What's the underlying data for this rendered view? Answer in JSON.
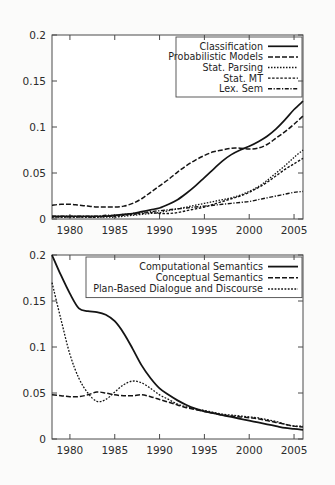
{
  "page": {
    "background": "#fbfbfa",
    "plot_background": "#ffffff",
    "axis_color": "#4a4a4a",
    "line_color": "#141414"
  },
  "chart_data": [
    {
      "id": "top",
      "type": "line",
      "title": "",
      "xlabel": "",
      "ylabel": "",
      "xlim": [
        1978,
        2006
      ],
      "ylim": [
        0,
        0.2
      ],
      "xticks": [
        1980,
        1985,
        1990,
        1995,
        2000,
        2005
      ],
      "yticks": [
        0,
        0.05,
        0.1,
        0.15,
        0.2
      ],
      "ytick_labels": [
        "0",
        "0.05",
        "0.1",
        "0.15",
        "0.2"
      ],
      "xtick_labels": [
        "1980",
        "1985",
        "1990",
        "1995",
        "2000",
        "2005"
      ],
      "grid": false,
      "legend_position": "top-right",
      "x": [
        1978,
        1979,
        1980,
        1981,
        1982,
        1983,
        1984,
        1985,
        1986,
        1987,
        1988,
        1989,
        1990,
        1991,
        1992,
        1993,
        1994,
        1995,
        1996,
        1997,
        1998,
        1999,
        2000,
        2001,
        2002,
        2003,
        2004,
        2005,
        2006
      ],
      "series": [
        {
          "name": "Classification",
          "style": "solid",
          "width": 1.7,
          "dash": "none",
          "values": [
            0.003,
            0.003,
            0.003,
            0.003,
            0.003,
            0.003,
            0.003,
            0.004,
            0.005,
            0.006,
            0.008,
            0.01,
            0.012,
            0.016,
            0.021,
            0.028,
            0.036,
            0.045,
            0.054,
            0.063,
            0.07,
            0.075,
            0.079,
            0.084,
            0.09,
            0.098,
            0.108,
            0.119,
            0.128
          ]
        },
        {
          "name": "Probabilistic Models",
          "style": "dashed",
          "width": 1.5,
          "dash": "5,2",
          "values": [
            0.015,
            0.016,
            0.016,
            0.015,
            0.014,
            0.013,
            0.013,
            0.013,
            0.014,
            0.017,
            0.022,
            0.029,
            0.036,
            0.043,
            0.051,
            0.058,
            0.064,
            0.069,
            0.073,
            0.075,
            0.077,
            0.077,
            0.076,
            0.077,
            0.081,
            0.088,
            0.095,
            0.103,
            0.112
          ]
        },
        {
          "name": "Stat. Parsing",
          "style": "fine-dotted",
          "width": 1.3,
          "dash": "1.5,1.5",
          "values": [
            0.002,
            0.002,
            0.002,
            0.002,
            0.002,
            0.002,
            0.002,
            0.002,
            0.003,
            0.004,
            0.005,
            0.006,
            0.007,
            0.009,
            0.011,
            0.013,
            0.015,
            0.017,
            0.019,
            0.021,
            0.023,
            0.026,
            0.03,
            0.035,
            0.042,
            0.05,
            0.058,
            0.067,
            0.075
          ]
        },
        {
          "name": "Stat. MT",
          "style": "dotted",
          "width": 1.4,
          "dash": "2.5,1.6",
          "values": [
            0.002,
            0.002,
            0.002,
            0.002,
            0.002,
            0.002,
            0.003,
            0.003,
            0.004,
            0.005,
            0.006,
            0.007,
            0.006,
            0.006,
            0.007,
            0.009,
            0.011,
            0.013,
            0.016,
            0.019,
            0.022,
            0.025,
            0.029,
            0.034,
            0.04,
            0.047,
            0.054,
            0.06,
            0.066
          ]
        },
        {
          "name": "Lex. Sem",
          "style": "dash-dot",
          "width": 1.4,
          "dash": "4,1.6,1.2,1.6",
          "values": [
            0.003,
            0.003,
            0.003,
            0.003,
            0.003,
            0.003,
            0.004,
            0.004,
            0.005,
            0.006,
            0.007,
            0.008,
            0.009,
            0.01,
            0.011,
            0.012,
            0.013,
            0.014,
            0.015,
            0.016,
            0.017,
            0.018,
            0.019,
            0.021,
            0.023,
            0.025,
            0.027,
            0.029,
            0.03
          ]
        }
      ]
    },
    {
      "id": "bottom",
      "type": "line",
      "title": "",
      "xlabel": "",
      "ylabel": "",
      "xlim": [
        1978,
        2006
      ],
      "ylim": [
        0,
        0.2
      ],
      "xticks": [
        1980,
        1985,
        1990,
        1995,
        2000,
        2005
      ],
      "yticks": [
        0,
        0.05,
        0.1,
        0.15,
        0.2
      ],
      "ytick_labels": [
        "0",
        "0.05",
        "0.1",
        "0.15",
        "0.2"
      ],
      "xtick_labels": [
        "1980",
        "1985",
        "1990",
        "1995",
        "2000",
        "2005"
      ],
      "grid": false,
      "legend_position": "top-right",
      "x": [
        1978,
        1979,
        1980,
        1981,
        1982,
        1983,
        1984,
        1985,
        1986,
        1987,
        1988,
        1989,
        1990,
        1991,
        1992,
        1993,
        1994,
        1995,
        1996,
        1997,
        1998,
        1999,
        2000,
        2001,
        2002,
        2003,
        2004,
        2005,
        2006
      ],
      "series": [
        {
          "name": "Computational Semantics",
          "style": "solid",
          "width": 1.8,
          "dash": "none",
          "values": [
            0.2,
            0.178,
            0.158,
            0.142,
            0.139,
            0.138,
            0.135,
            0.128,
            0.115,
            0.098,
            0.08,
            0.066,
            0.055,
            0.048,
            0.042,
            0.037,
            0.033,
            0.03,
            0.028,
            0.026,
            0.024,
            0.022,
            0.02,
            0.018,
            0.016,
            0.014,
            0.012,
            0.011,
            0.01
          ]
        },
        {
          "name": "Conceptual Semantics",
          "style": "dashed",
          "width": 1.5,
          "dash": "5,2",
          "values": [
            0.048,
            0.047,
            0.046,
            0.046,
            0.048,
            0.051,
            0.05,
            0.048,
            0.047,
            0.047,
            0.048,
            0.046,
            0.043,
            0.04,
            0.037,
            0.034,
            0.032,
            0.03,
            0.028,
            0.026,
            0.025,
            0.024,
            0.023,
            0.022,
            0.02,
            0.018,
            0.016,
            0.014,
            0.013
          ]
        },
        {
          "name": "Plan-Based Dialogue and Discourse",
          "style": "fine-dotted",
          "width": 1.3,
          "dash": "1.8,1.5",
          "values": [
            0.17,
            0.13,
            0.092,
            0.066,
            0.05,
            0.041,
            0.043,
            0.051,
            0.059,
            0.063,
            0.061,
            0.055,
            0.048,
            0.043,
            0.038,
            0.035,
            0.033,
            0.031,
            0.029,
            0.027,
            0.026,
            0.025,
            0.024,
            0.023,
            0.021,
            0.019,
            0.016,
            0.014,
            0.014
          ]
        }
      ]
    }
  ]
}
